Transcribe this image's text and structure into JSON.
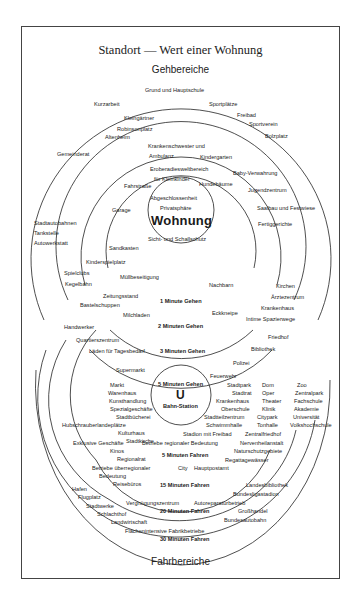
{
  "title": "Standort — Wert einer Wohnung",
  "top_section": "Gehbereiche",
  "bottom_section": "Fahrbereiche",
  "center": {
    "label": "Wohnung",
    "items": [
      "Abgeschlossenheit",
      "Privatsphäre",
      "Sicht- und Schallschutz"
    ]
  },
  "walk_rings": [
    {
      "label": "1 Minute Gehen",
      "items": [
        "Eroberadiesweltbereich",
        "für Kleinkinder",
        "Fahrstraße",
        "Hundebäume",
        "Garage",
        "Sandkasten",
        "Kinderspielplatz",
        "Müllbeseitigung",
        "Nachbarn"
      ]
    },
    {
      "label": "2 Minuten Gehen",
      "items": [
        "Krankenschwester und",
        "Ambulanz",
        "Kindergarten",
        "Baby-Verwahrung",
        "Altenheim",
        "Jugendzentrum",
        "Fertiggerichte",
        "Zeitungsstand",
        "Milchladen",
        "Eckkneipe",
        "Kirchen"
      ]
    },
    {
      "label": "3 Minuten Gehen",
      "items": [
        "Kleingärtner",
        "Robinsonplatz",
        "Sportverein",
        "Bolzplatz",
        "Saalbau und Festwiese",
        "Spielclubs",
        "Kegelbahn",
        "Bastelschuppen",
        "Ärztezentrum",
        "Krankenhaus",
        "Intime Spazierwege",
        "Quartierszentrum",
        "Läden für Tagesbedarf"
      ]
    },
    {
      "label": "",
      "items": [
        "Grund und Hauptschule",
        "Kurzarbeit",
        "Sportplätze",
        "Freibad",
        "Gemeinderat",
        "Stadtautobahnen",
        "Tankstelle",
        "Autowerkstatt",
        "Handwerker",
        "Friedhof"
      ]
    }
  ],
  "drive_rings": [
    {
      "label": "5 Minuten Gehen",
      "station_symbol": "U",
      "station_label": "Bahn-Station",
      "items": [
        "Supermarkt",
        "Bibliothek",
        "Polizei",
        "Feuerwehr"
      ]
    },
    {
      "label": "5 Minuten Fahren",
      "items": [
        "Markt",
        "Warenhaus",
        "Kunsthandlung",
        "Spezialgeschäfte",
        "Stadtbücherei",
        "Kulturhaus",
        "Stadtkirche",
        "Stadtpark",
        "Stadtrat",
        "Krankenhaus",
        "Oberschule",
        "Stadtteilzentrum",
        "Schwimmhalle",
        "Stadion mit Freibad",
        "Betriebe regionaler Bedeutung"
      ]
    },
    {
      "label": "15 Minuten Fahren",
      "items": [
        "Hubschrauberlandeplätze",
        "Exklusive Geschäfte",
        "Kinos",
        "Regionalrat",
        "Betriebe überregionaler",
        "Bedeutung",
        "Reisebüros",
        "City",
        "Hauptpostamt",
        "Dom",
        "Oper",
        "Theater",
        "Klinik",
        "Citypark",
        "Tonhalle",
        "Zentralfriedhof",
        "Nervenheilanstalt",
        "Naturschutzgebiete",
        "Regattagewässer"
      ]
    },
    {
      "label": "20 Minuten Fahren",
      "items": [
        "Hafen",
        "Flugplatz",
        "Stadtwerke",
        "Vergnügungszentrum",
        "Autoreparaturbetrieb",
        "Zoo",
        "Zentralpark",
        "Fachschule",
        "Akademie",
        "Universität",
        "Volkshochschule",
        "Landesbibliothek",
        "Bundesligastadion"
      ]
    },
    {
      "label": "30 Minuten Fahren",
      "items": [
        "Schlachthof",
        "Landwirtschaft",
        "Flächenintensive Fabrikbetriebe",
        "Großhandel",
        "Bundesautobahn"
      ]
    }
  ]
}
